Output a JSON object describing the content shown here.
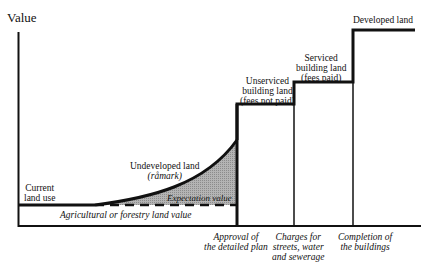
{
  "axis": {
    "y_label": "Value"
  },
  "labels": {
    "current_land_use": [
      "Current",
      "land use"
    ],
    "undeveloped_land": "Undeveloped land",
    "ramark": "(råmark)",
    "expectation_value": "Expectation value",
    "agricultural": "Agricultural or forestry land value",
    "unserviced": [
      "Unserviced",
      "building land",
      "(fees not paid)"
    ],
    "serviced": [
      "Serviced",
      "building land",
      "(fees paid)"
    ],
    "developed": "Developed land"
  },
  "x_events": {
    "approval": [
      "Approval of",
      "the detailed plan"
    ],
    "charges": [
      "Charges for",
      "streets, water",
      "and sewerage"
    ],
    "completion": [
      "Completion of",
      "the buildings"
    ]
  },
  "colors": {
    "line": "#111111",
    "shade": "#a8a8a8"
  }
}
